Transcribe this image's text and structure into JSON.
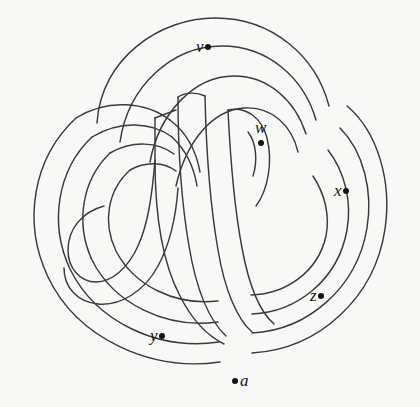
{
  "figure": {
    "kind": "knot-diagram",
    "background_color": "#f8f8f6",
    "stroke_color": "#2b2b2b",
    "label_color": "#141414",
    "width": 420,
    "height": 407
  },
  "labels": [
    {
      "id": "v",
      "text": "v",
      "dot_position": "right",
      "x": 196,
      "y": 38
    },
    {
      "id": "w",
      "text": "w",
      "dot_position": "below",
      "x": 255,
      "y": 119
    },
    {
      "id": "x",
      "text": "x",
      "dot_position": "right",
      "x": 334,
      "y": 182
    },
    {
      "id": "z",
      "text": "z",
      "dot_position": "right",
      "x": 310,
      "y": 287
    },
    {
      "id": "y",
      "text": "y",
      "dot_position": "right",
      "x": 150,
      "y": 327
    },
    {
      "id": "a",
      "text": "a",
      "dot_position": "left",
      "x": 232,
      "y": 372
    }
  ],
  "curves": [
    {
      "id": "outer-top-left-arc",
      "d": "M 97 123 C 101 58, 160 18, 215 18 C 272 18, 316 56, 329 106"
    },
    {
      "id": "outer-right-arc",
      "d": "M 347 106 C 378 132, 392 182, 385 229 C 375 297, 320 349, 252 353"
    },
    {
      "id": "outer-bottom-left-arc",
      "d": "M 220 362 C 150 372, 77 338, 48 277 C 22 222, 33 158, 76 118"
    },
    {
      "id": "band2-top-left-arc",
      "d": "M 120 142 C 128 86, 172 46, 222 46 C 268 46, 304 78, 316 120"
    },
    {
      "id": "band2-right-arc",
      "d": "M 340 128 C 364 152, 373 192, 367 228 C 357 288, 308 330, 252 333"
    },
    {
      "id": "band2-bottom-arc",
      "d": "M 219 342 C 158 351, 96 322, 70 269 C 49 224, 57 170, 92 137"
    },
    {
      "id": "band3-top-arc",
      "d": "M 150 162 C 159 113, 194 76, 234 76 C 268 76, 295 100, 306 134"
    },
    {
      "id": "band3-right-arc",
      "d": "M 328 150 C 345 172, 352 202, 347 230 C 338 280, 297 312, 252 314"
    },
    {
      "id": "band3-bottom-arc",
      "d": "M 218 322 C 166 329, 114 304, 92 260 C 75 223, 82 180, 110 153"
    },
    {
      "id": "band4-arc",
      "d": "M 176 186 C 186 142, 212 110, 244 108 C 272 106, 292 126, 298 152"
    },
    {
      "id": "band4-right-arc",
      "d": "M 313 176 C 325 194, 330 216, 326 236 C 318 272, 286 294, 251 295"
    },
    {
      "id": "band4-bottom-arc",
      "d": "M 218 301 C 176 306, 134 286, 116 251 C 102 222, 108 190, 130 170"
    },
    {
      "id": "center-band-left-edge",
      "d": "M 155 118 L 155 160 C 155 212, 162 262, 180 296 C 192 320, 208 336, 224 344"
    },
    {
      "id": "center-band-mid-edge",
      "d": "M 178 97 C 178 140, 181 200, 189 246 C 196 288, 209 320, 226 336"
    },
    {
      "id": "center-band-right-edge",
      "d": "M 205 96 C 206 142, 210 204, 218 250 C 225 292, 238 320, 252 332"
    },
    {
      "id": "center-band-far-edge",
      "d": "M 228 110 C 230 152, 234 206, 242 248 C 249 286, 260 312, 274 324"
    },
    {
      "id": "center-cap-top",
      "d": "M 178 97 C 186 92, 197 92, 205 96"
    },
    {
      "id": "center-cap-left",
      "d": "M 155 118 L 176 110"
    },
    {
      "id": "spiral-inner-hook",
      "d": "M 228 110 C 246 106, 262 118, 267 138 C 273 162, 268 190, 256 206"
    },
    {
      "id": "spiral-inner-hook2",
      "d": "M 248 132 C 256 142, 258 160, 253 176"
    },
    {
      "id": "left-band-outer",
      "d": "M 76 118 C 108 98, 146 102, 170 120"
    },
    {
      "id": "left-spiral-a",
      "d": "M 92 137 C 120 120, 152 122, 172 137"
    },
    {
      "id": "left-spiral-b",
      "d": "M 110 153 C 133 140, 158 142, 174 154"
    },
    {
      "id": "left-spiral-c",
      "d": "M 130 170 C 146 161, 164 162, 176 171"
    },
    {
      "id": "left-inner-loop",
      "d": "M 155 160 C 152 196, 148 224, 138 246 C 128 268, 112 282, 96 282 C 80 282, 68 268, 68 250 C 68 229, 82 212, 104 206"
    },
    {
      "id": "left-inner-loop2",
      "d": "M 178 188 C 176 216, 170 244, 158 266 C 144 292, 120 306, 98 304 C 78 302, 64 288, 64 268"
    },
    {
      "id": "left-arm-upper",
      "d": "M 170 120 C 186 132, 196 150, 200 172"
    },
    {
      "id": "left-arm-lower",
      "d": "M 172 137 C 186 150, 194 168, 197 186"
    }
  ]
}
